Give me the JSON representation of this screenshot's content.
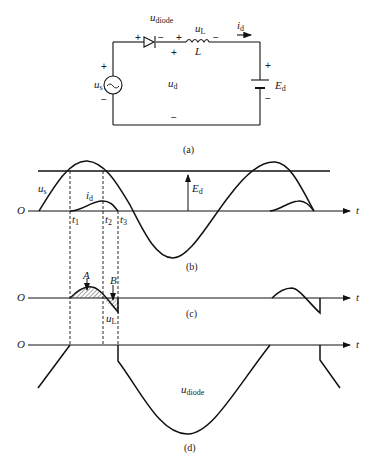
{
  "circuit": {
    "caption": "(a)",
    "source_label": "u",
    "source_sub": "s",
    "source_symbol": "~",
    "diode_label": "u",
    "diode_sub": "diode",
    "inductor_voltage_label": "u",
    "inductor_voltage_sub": "L",
    "inductor_label": "L",
    "current_label": "i",
    "current_sub": "d",
    "output_label": "u",
    "output_sub": "d",
    "battery_label": "E",
    "battery_sub": "d",
    "plus": "+",
    "minus": "−"
  },
  "panel_b": {
    "caption": "(b)",
    "origin": "O",
    "axis_label": "t",
    "us_label": "u",
    "us_sub": "s",
    "id_label": "i",
    "id_sub": "d",
    "ed_label": "E",
    "ed_sub": "d",
    "t1_label": "t",
    "t1_sub": "1",
    "t2_label": "t",
    "t2_sub": "2",
    "t3_label": "t",
    "t3_sub": "3"
  },
  "panel_c": {
    "caption": "(c)",
    "origin": "O",
    "axis_label": "t",
    "area_a_label": "A",
    "area_b_label": "B",
    "ul_label": "u",
    "ul_sub": "L"
  },
  "panel_d": {
    "caption": "(d)",
    "origin": "O",
    "axis_label": "t",
    "udiode_label": "u",
    "udiode_sub": "diode"
  }
}
